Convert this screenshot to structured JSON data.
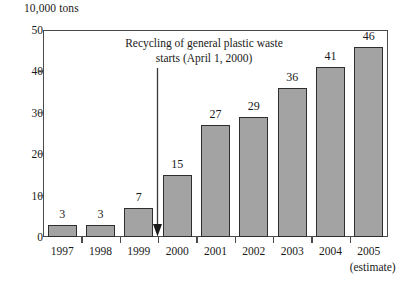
{
  "chart_data": {
    "type": "bar",
    "title": "",
    "ylabel": "10,000 tons",
    "xlabel": "",
    "ylim": [
      0,
      50
    ],
    "yticks": [
      0,
      10,
      20,
      30,
      40,
      50
    ],
    "grid": false,
    "legend": "none",
    "categories": [
      "1997",
      "1998",
      "1999",
      "2000",
      "2001",
      "2002",
      "2003",
      "2004",
      "2005"
    ],
    "values": [
      3,
      3,
      7,
      15,
      27,
      29,
      36,
      41,
      46
    ],
    "category_sublabels": [
      "",
      "",
      "",
      "",
      "",
      "",
      "",
      "",
      "(estimate)"
    ],
    "data_labels": [
      "3",
      "3",
      "7",
      "15",
      "27",
      "29",
      "36",
      "41",
      "46"
    ],
    "annotations": [
      {
        "text": "Recycling of general plastic waste\nstarts (April 1, 2000)",
        "arrow": "down-arrow-icon",
        "points_to_category_boundary": "1999/2000"
      }
    ],
    "colors": {
      "bar_fill": "#a3a3a3",
      "bar_stroke": "#2e2e2e",
      "axis": "#4a4a4a",
      "text": "#1a1a1a",
      "background": "#ffffff"
    }
  }
}
